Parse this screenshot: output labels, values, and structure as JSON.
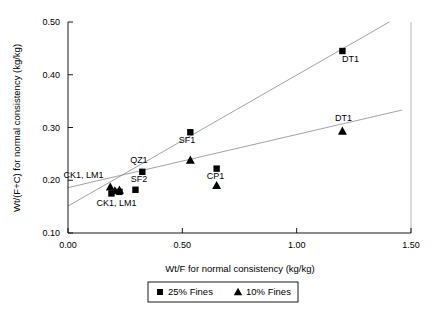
{
  "chart_data": {
    "type": "scatter",
    "title": "",
    "xlabel": "Wt/F for normal consistency (kg/kg)",
    "ylabel": "Wt/(F+C) for normal consistency (kg/kg)",
    "xlim": [
      0.0,
      1.5
    ],
    "ylim": [
      0.1,
      0.5
    ],
    "xticks": [
      "0.00",
      "0.50",
      "1.00",
      "1.50"
    ],
    "xtick_values": [
      0.0,
      0.5,
      1.0,
      1.5
    ],
    "yticks": [
      "0.10",
      "0.20",
      "0.30",
      "0.40",
      "0.50"
    ],
    "ytick_values": [
      0.1,
      0.2,
      0.3,
      0.4,
      0.5
    ],
    "grid": false,
    "legend_position": "bottom-center",
    "series": [
      {
        "name": "25% Fines",
        "marker": "square",
        "color": "#000000",
        "points": [
          {
            "x": 0.19,
            "y": 0.175,
            "label": "CK1, LM1"
          },
          {
            "x": 0.225,
            "y": 0.178,
            "label": ""
          },
          {
            "x": 0.295,
            "y": 0.182,
            "label": "SF2"
          },
          {
            "x": 0.325,
            "y": 0.216,
            "label": "QZ1"
          },
          {
            "x": 0.535,
            "y": 0.291,
            "label": "SF1"
          },
          {
            "x": 0.65,
            "y": 0.222,
            "label": "CP1"
          },
          {
            "x": 1.2,
            "y": 0.445,
            "label": "DT1"
          }
        ],
        "trend": {
          "x0": 0.0,
          "y0": 0.151,
          "x1": 1.405,
          "y1": 0.5
        }
      },
      {
        "name": "10% Fines",
        "marker": "triangle",
        "color": "#000000",
        "points": [
          {
            "x": 0.185,
            "y": 0.187,
            "label": "CK1, LM1"
          },
          {
            "x": 0.205,
            "y": 0.18,
            "label": ""
          },
          {
            "x": 0.225,
            "y": 0.181,
            "label": ""
          },
          {
            "x": 0.535,
            "y": 0.238,
            "label": ""
          },
          {
            "x": 0.65,
            "y": 0.19,
            "label": ""
          },
          {
            "x": 1.2,
            "y": 0.293,
            "label": "DT1"
          }
        ],
        "trend": {
          "x0": 0.0,
          "y0": 0.186,
          "x1": 1.46,
          "y1": 0.333
        }
      }
    ],
    "annotations": [
      {
        "text": "CK1, LM1",
        "x": 0.155,
        "y": 0.205,
        "anchor": "end"
      },
      {
        "text": "CK1, LM1",
        "x": 0.125,
        "y": 0.152,
        "anchor": "start"
      },
      {
        "text": "QZ1",
        "x": 0.31,
        "y": 0.232,
        "anchor": "middle"
      },
      {
        "text": "SF2",
        "x": 0.31,
        "y": 0.196,
        "anchor": "middle"
      },
      {
        "text": "SF1",
        "x": 0.52,
        "y": 0.271,
        "anchor": "middle"
      },
      {
        "text": "CP1",
        "x": 0.645,
        "y": 0.203,
        "anchor": "middle"
      },
      {
        "text": "DT1",
        "x": 1.235,
        "y": 0.424,
        "anchor": "middle"
      },
      {
        "text": "DT1",
        "x": 1.205,
        "y": 0.312,
        "anchor": "middle"
      }
    ]
  },
  "legend": {
    "entries": [
      {
        "label": "25% Fines",
        "marker": "square"
      },
      {
        "label": "10% Fines",
        "marker": "triangle"
      }
    ]
  }
}
